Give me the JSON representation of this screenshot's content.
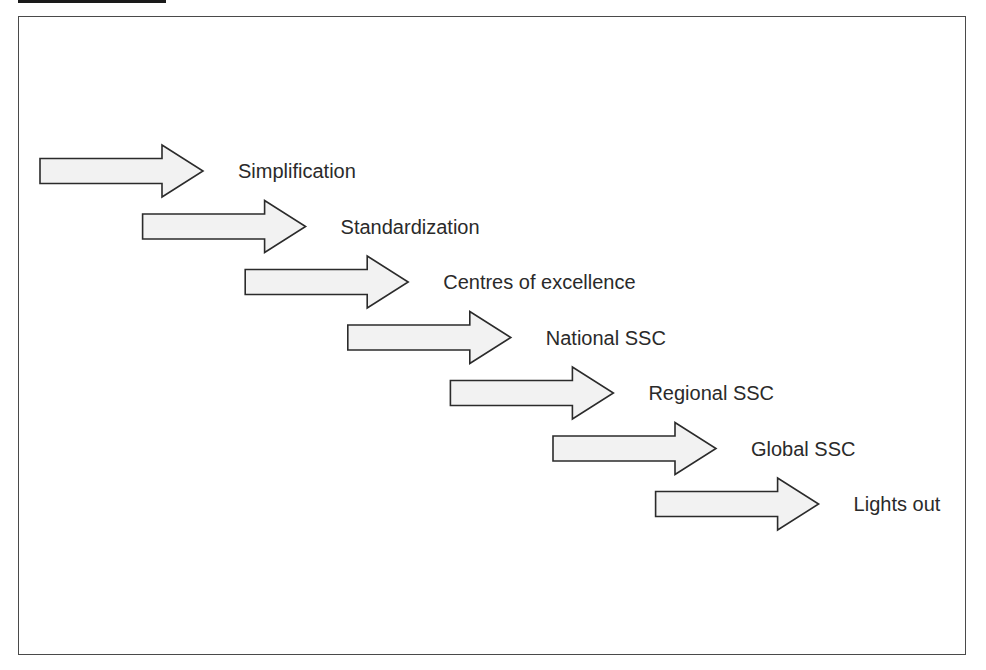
{
  "diagram": {
    "type": "staircase-arrow-progression",
    "steps": [
      {
        "label": "Simplification"
      },
      {
        "label": "Standardization"
      },
      {
        "label": "Centres of excellence"
      },
      {
        "label": "National SSC"
      },
      {
        "label": "Regional SSC"
      },
      {
        "label": "Global SSC"
      },
      {
        "label": "Lights out"
      }
    ],
    "colors": {
      "arrow_fill": "#f2f2f2",
      "arrow_stroke": "#2b2b2b",
      "text": "#2a2a2a",
      "frame": "#4a4a4a"
    }
  }
}
